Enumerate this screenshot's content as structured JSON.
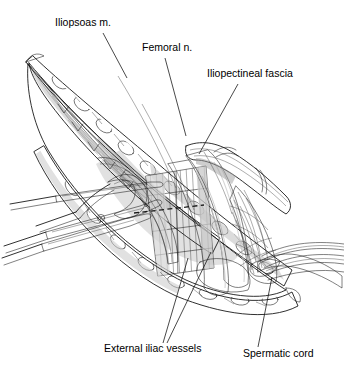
{
  "figure": {
    "type": "surgical-anatomy-line-drawing",
    "background_color": "#ffffff",
    "ink_color": "#1a1a1a",
    "width": 344,
    "height": 382
  },
  "labels": [
    {
      "id": "iliopsoas",
      "text": "Iliopsoas m.",
      "text_x": 55,
      "text_y": 26,
      "anchor": "start",
      "leader": "M 103 33 L 127 78",
      "structure": "iliopsoas-muscle"
    },
    {
      "id": "femoral-nerve",
      "text": "Femoral n.",
      "text_x": 142,
      "text_y": 51,
      "anchor": "start",
      "leader": "M 165 58 L 186 136",
      "structure": "femoral-nerve"
    },
    {
      "id": "iliopectineal-fascia",
      "text": "Iliopectineal fascia",
      "text_x": 207,
      "text_y": 77,
      "anchor": "start",
      "leader": "M 238 84 L 199 154",
      "structure": "iliopectineal-fascia"
    },
    {
      "id": "external-iliac-vessels",
      "text": "External iliac vessels",
      "text_x": 104,
      "text_y": 352,
      "anchor": "start",
      "leader": "M 163 343 L 188 258",
      "leader2": "M 167 343 L 211 252",
      "structure": "external-iliac-vessels"
    },
    {
      "id": "spermatic-cord",
      "text": "Spermatic cord",
      "text_x": 243,
      "text_y": 357,
      "anchor": "start",
      "leader": "M 258 347 L 272 277",
      "structure": "spermatic-cord"
    }
  ],
  "structures": [
    {
      "id": "wound-edge-upper",
      "name": "Upper wound edge / retracted abdominal wall",
      "tone": "light"
    },
    {
      "id": "wound-edge-lower",
      "name": "Lower wound edge / inguinal ligament",
      "tone": "light"
    },
    {
      "id": "iliopsoas-muscle",
      "name": "Iliopsoas muscle with striated fibers",
      "tone": "mid"
    },
    {
      "id": "iliopectineal-fascia",
      "name": "Iliopectineal fascia panel",
      "tone": "light"
    },
    {
      "id": "external-iliac-artery",
      "name": "External iliac artery",
      "tone": "dark"
    },
    {
      "id": "external-iliac-vein",
      "name": "External iliac vein",
      "tone": "dark"
    },
    {
      "id": "femoral-nerve",
      "name": "Femoral nerve",
      "tone": "mid"
    },
    {
      "id": "spermatic-cord",
      "name": "Spermatic cord strands",
      "tone": "light"
    },
    {
      "id": "mesh-patch",
      "name": "Crosshatched mesh / obturator region",
      "tone": "dark"
    },
    {
      "id": "retractor-band",
      "name": "Pale retractor band crossing vessels",
      "tone": "light"
    },
    {
      "id": "scissors",
      "name": "Surgical scissors",
      "tone": "light"
    },
    {
      "id": "forceps",
      "name": "Surgical forceps",
      "tone": "light"
    },
    {
      "id": "dashed-incision",
      "name": "Dashed incision line on fascia",
      "tone": "line"
    }
  ]
}
